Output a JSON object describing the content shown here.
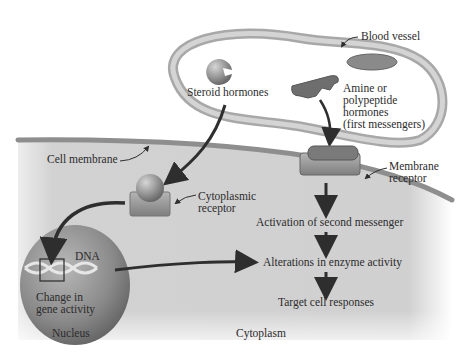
{
  "diagram": {
    "labels": {
      "blood_vessel": "Blood vessel",
      "steroid_hormones": "Steroid hormones",
      "amine_line1": "Amine or",
      "amine_line2": "polypeptide",
      "amine_line3": "hormones",
      "amine_line4": "(first messengers)",
      "cell_membrane": "Cell membrane",
      "membrane_receptor_line1": "Membrane",
      "membrane_receptor_line2": "receptor",
      "cytoplasmic_receptor_line1": "Cytoplasmic",
      "cytoplasmic_receptor_line2": "receptor",
      "dna": "DNA",
      "gene_line1": "Change in",
      "gene_line2": "gene activity",
      "nucleus": "Nucleus",
      "cytoplasm": "Cytoplasm",
      "activation": "Activation of second messenger",
      "alterations": "Alterations in enzyme activity",
      "target": "Target cell responses"
    },
    "colors": {
      "cytoplasm": "#cfcfcf",
      "membrane": "#9a9a9a",
      "vessel": "#bdbdbd",
      "nucleus": "#8c8c8c",
      "arrow": "#2e2e2e",
      "text": "#2b2b2b"
    }
  }
}
